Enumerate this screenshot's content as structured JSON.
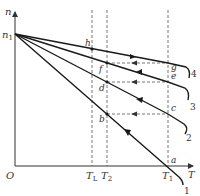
{
  "diagram": {
    "axes": {
      "y_label": "n",
      "x_label": "T",
      "origin_label": "O",
      "y_tick_label": "n",
      "y_tick_sub": "1"
    },
    "x_ticks": [
      {
        "main": "T",
        "sub": "L"
      },
      {
        "main": "T",
        "sub": "2"
      },
      {
        "main": "T",
        "sub": "1"
      }
    ],
    "points": {
      "a": "a",
      "b": "b",
      "c": "c",
      "d": "d",
      "e": "e",
      "f": "f",
      "g": "g",
      "h": "h"
    },
    "curves": [
      "1",
      "2",
      "3",
      "4"
    ],
    "colors": {
      "line": "#1a1a1a",
      "dash": "#555555",
      "text": "#333333"
    }
  }
}
